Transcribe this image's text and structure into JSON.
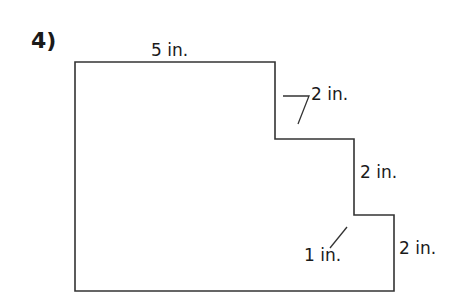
{
  "problem": {
    "number": "4)"
  },
  "figure": {
    "type": "composite-rectilinear-shape",
    "stroke_color": "#333333",
    "vertices": [
      [
        75,
        62
      ],
      [
        275,
        62
      ],
      [
        275,
        139
      ],
      [
        354,
        139
      ],
      [
        354,
        215
      ],
      [
        394,
        215
      ],
      [
        394,
        291
      ],
      [
        75,
        291
      ]
    ],
    "labels": {
      "top": "5 in.",
      "step_upper": "2 in.",
      "right_middle": "2 in.",
      "step_lower": "1 in.",
      "right_bottom": "2 in."
    }
  }
}
